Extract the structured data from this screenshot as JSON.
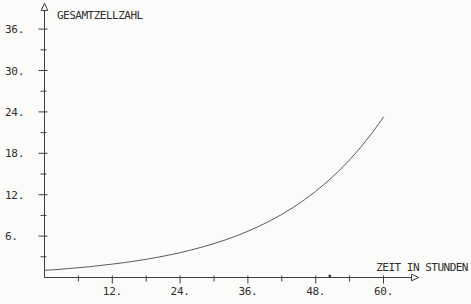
{
  "chart_data": {
    "type": "line",
    "title": "",
    "ylabel": "GESAMTZELLZAHL",
    "xlabel": "ZEIT IN STUNDEN",
    "grid": false,
    "legend": null,
    "xlim": [
      0,
      66
    ],
    "ylim": [
      0,
      39
    ],
    "x_ticks_major": [
      12,
      24,
      36,
      48,
      60
    ],
    "x_tick_labels": [
      "12.",
      "24.",
      "36.",
      "48.",
      "60."
    ],
    "x_ticks_minor": [
      6,
      18,
      30,
      42,
      54
    ],
    "y_ticks_major": [
      6,
      12,
      18,
      24,
      30,
      36
    ],
    "y_tick_labels": [
      "6.",
      "12.",
      "18.",
      "24.",
      "30.",
      "36."
    ],
    "y_ticks_minor": [
      3,
      9,
      15,
      21,
      27,
      33
    ],
    "series": [
      {
        "name": "Gesamtzellzahl",
        "x": [
          0,
          2,
          4,
          6,
          8,
          10,
          12,
          14,
          16,
          18,
          20,
          22,
          24,
          26,
          28,
          30,
          32,
          34,
          36,
          38,
          40,
          42,
          44,
          46,
          48,
          50,
          52,
          54,
          56,
          58,
          60
        ],
        "y": [
          1.04,
          1.15,
          1.28,
          1.42,
          1.57,
          1.75,
          1.94,
          2.15,
          2.38,
          2.64,
          2.93,
          3.25,
          3.6,
          4.0,
          4.43,
          4.92,
          5.45,
          6.05,
          6.71,
          7.44,
          8.25,
          9.15,
          10.15,
          11.26,
          12.49,
          13.85,
          15.36,
          17.04,
          18.9,
          20.96,
          23.24
        ]
      }
    ],
    "axis_marker_x": 50.5,
    "colors": {
      "background": "#fbfbf9",
      "axis": "#3f3f3f",
      "curve": "#5b5b5b",
      "text": "#2e2e2e"
    }
  }
}
